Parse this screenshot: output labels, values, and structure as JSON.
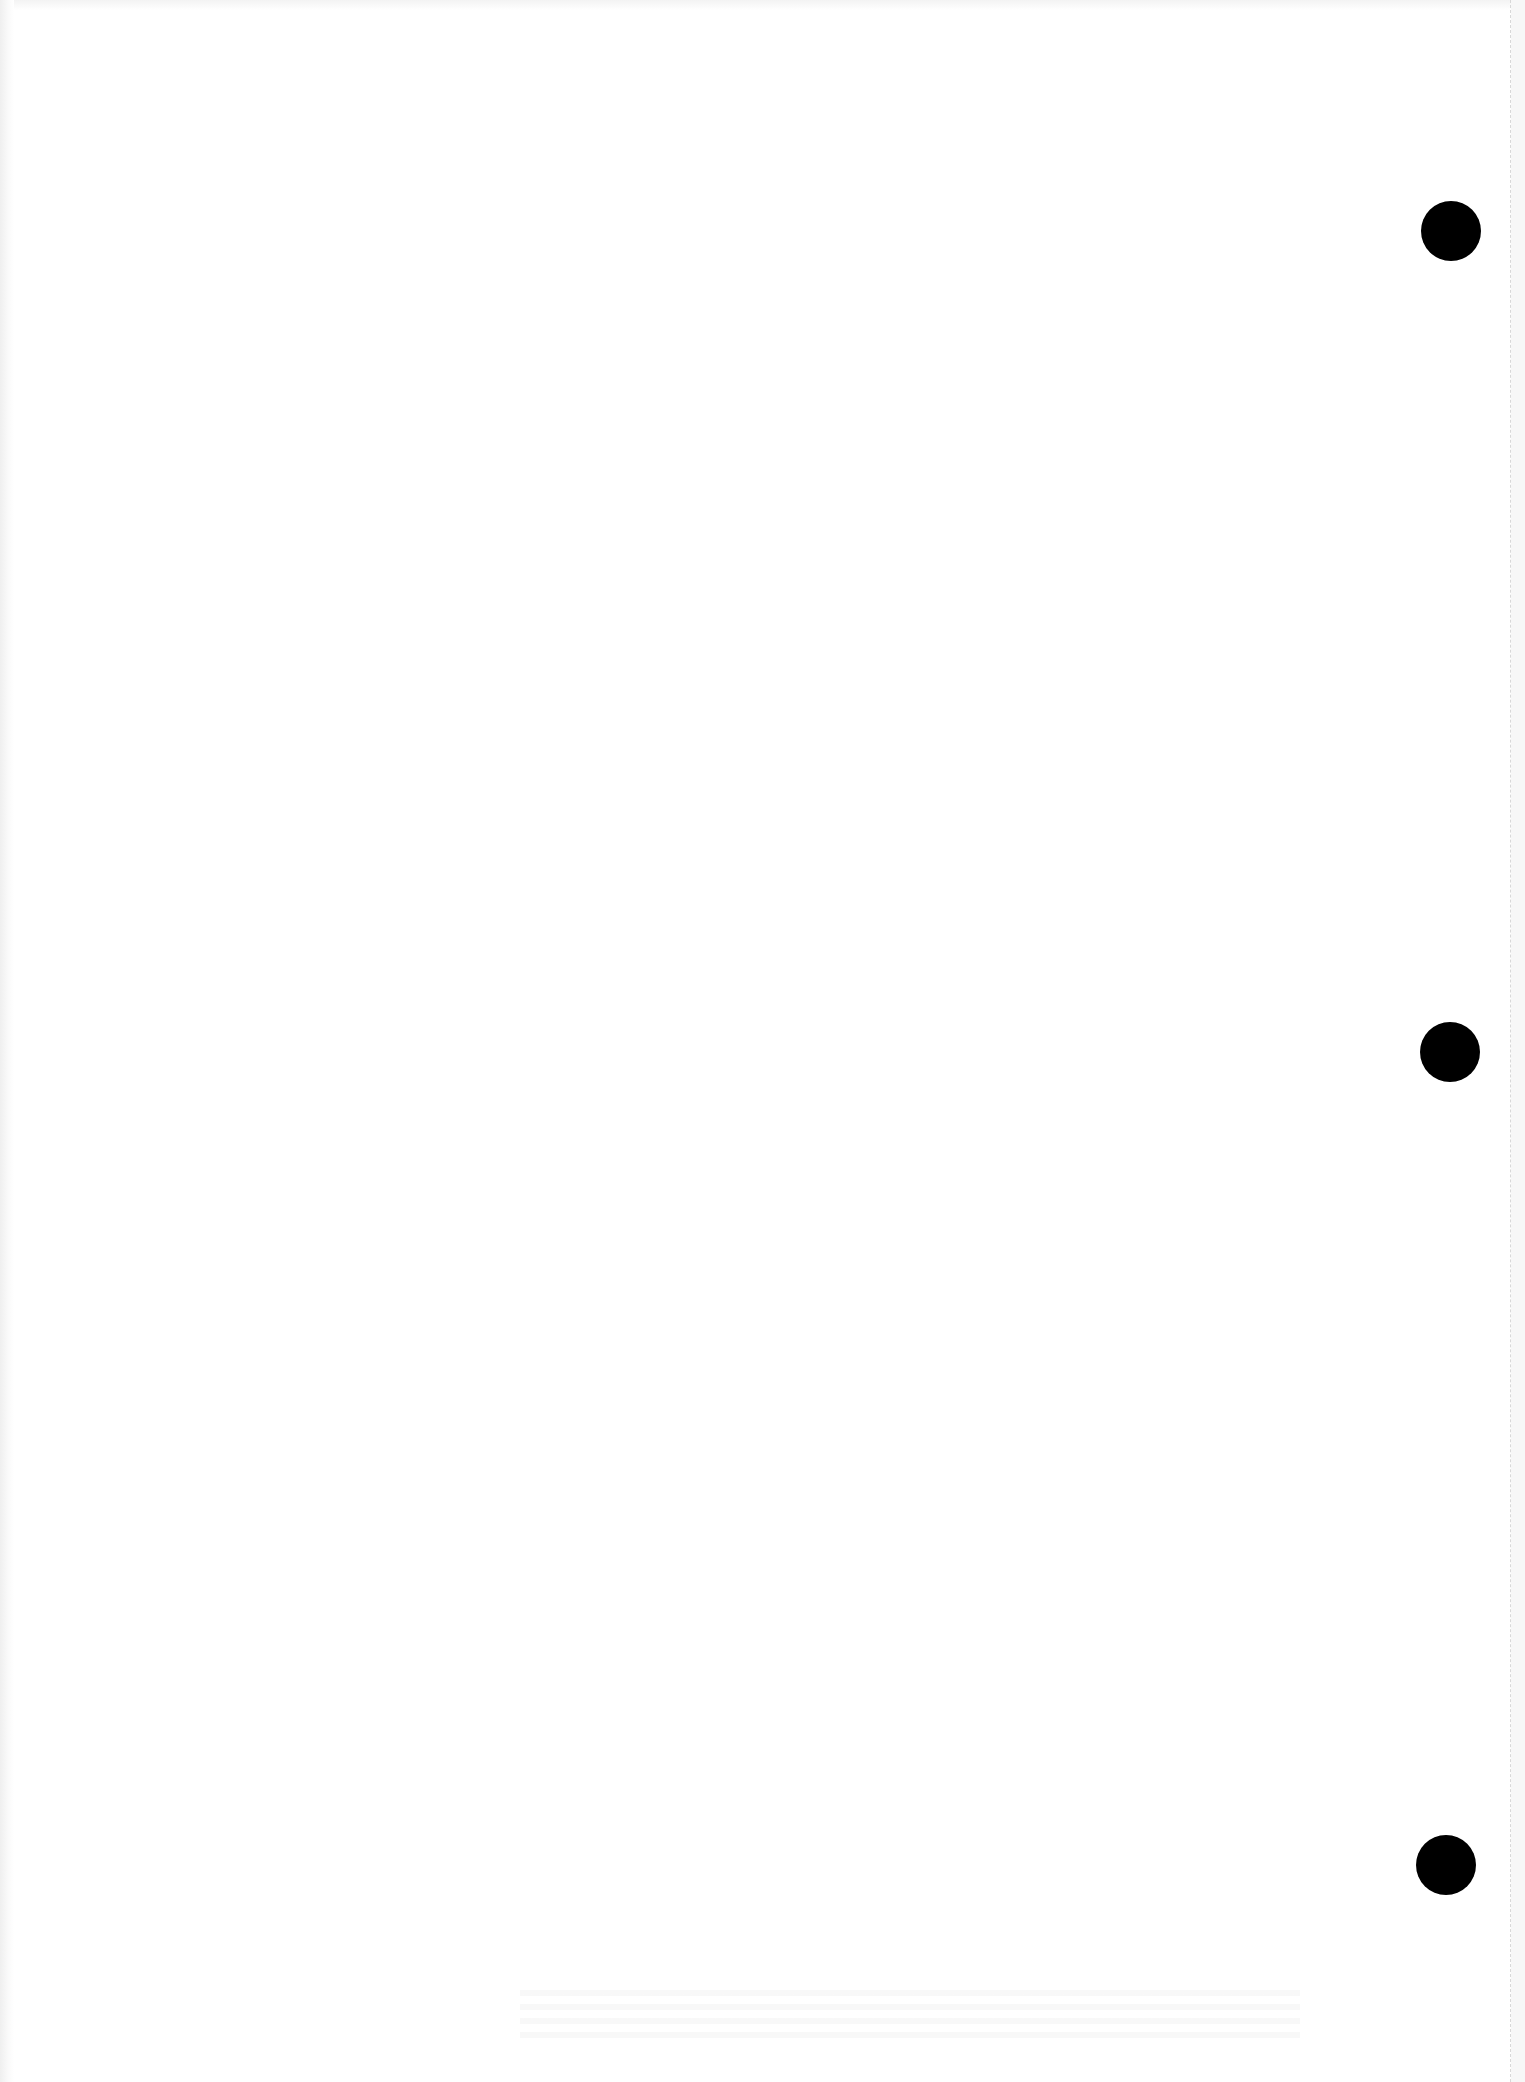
{
  "document": {
    "type": "blank scanned page",
    "background_color": "#ffffff",
    "punch_hole_color": "#000000",
    "punch_holes": [
      {
        "id": "top",
        "cx": 1451,
        "cy": 231,
        "diameter": 60
      },
      {
        "id": "middle",
        "cx": 1450,
        "cy": 1052,
        "diameter": 60
      },
      {
        "id": "bottom",
        "cx": 1446,
        "cy": 1865,
        "diameter": 60
      }
    ],
    "fold_line": {
      "x": 1510,
      "style": "dashed",
      "color": "#d8d8d8"
    }
  }
}
